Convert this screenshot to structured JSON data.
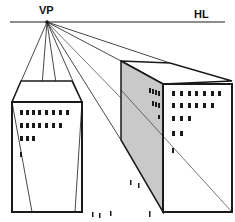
{
  "diagram": {
    "labels": {
      "vanishing_point": "VP",
      "horizon_line": "HL"
    },
    "colors": {
      "line": "#1a1a1a",
      "shade": "#c9c9c9",
      "background": "#ffffff"
    },
    "vanishing_point": {
      "x": 47,
      "y": 22
    },
    "horizon_y": 22,
    "buildings": [
      {
        "name": "left-building",
        "window_rows": [
          8,
          7,
          3,
          1
        ]
      },
      {
        "name": "right-building",
        "front_window_rows": [
          7,
          6,
          3,
          2,
          1
        ],
        "side_window_rows": [
          4,
          3,
          1
        ]
      }
    ],
    "people_count": 6
  }
}
